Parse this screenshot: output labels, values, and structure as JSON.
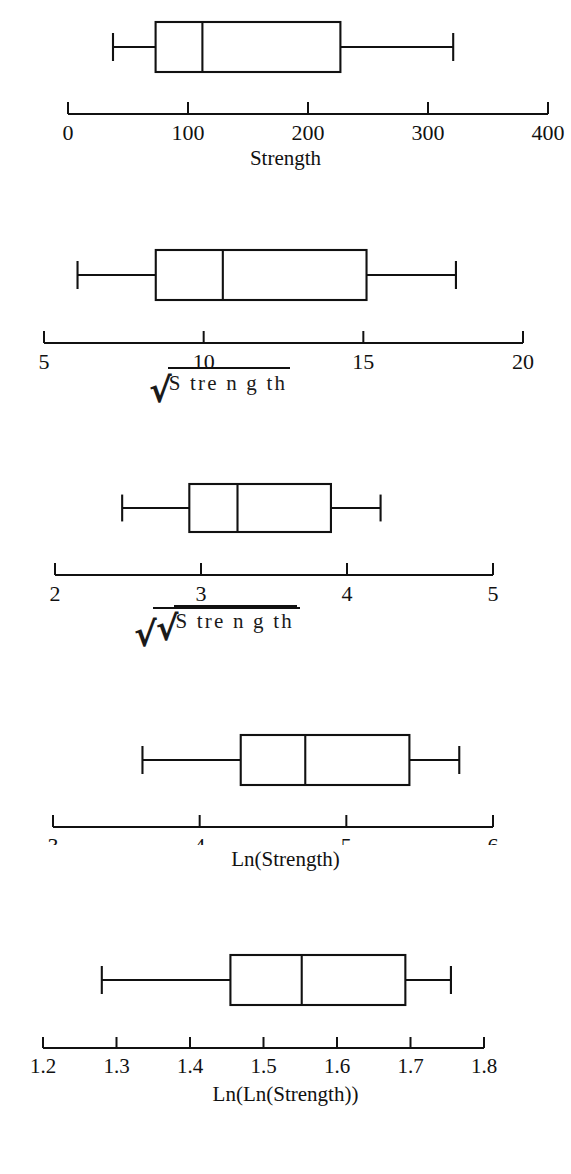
{
  "figure": {
    "title": "",
    "background": "#ffffff",
    "line_color": "#111111",
    "width": 571,
    "height": 1174
  },
  "chart_data": [
    {
      "type": "box",
      "id": "strength",
      "title": "",
      "xlabel": "Strength",
      "xlabel_kind": "plain",
      "xlim": [
        0,
        400
      ],
      "ticks": [
        0,
        100,
        200,
        300,
        400
      ],
      "tick_labels": [
        "0",
        "100",
        "200",
        "300",
        "400"
      ],
      "grid": false,
      "orientation": "horizontal",
      "stats": {
        "min": 37.5,
        "q1": 73.0,
        "median": 112.0,
        "q3": 227.0,
        "max": 321.0
      }
    },
    {
      "type": "box",
      "id": "sqrt-strength",
      "title": "",
      "xlabel": "Strength",
      "xlabel_kind": "sqrt",
      "xlim": [
        5,
        20
      ],
      "ticks": [
        5,
        10,
        15,
        20
      ],
      "tick_labels": [
        "5",
        "10",
        "15",
        "20"
      ],
      "grid": false,
      "orientation": "horizontal",
      "stats": {
        "min": 6.05,
        "q1": 8.5,
        "median": 10.6,
        "q3": 15.1,
        "max": 17.9
      }
    },
    {
      "type": "box",
      "id": "fourth-root-strength",
      "title": "",
      "xlabel": "Strength",
      "xlabel_kind": "sqrt-sqrt",
      "xlim": [
        2,
        5
      ],
      "ticks": [
        2,
        3,
        4,
        5
      ],
      "tick_labels": [
        "2",
        "3",
        "4",
        "5"
      ],
      "grid": false,
      "orientation": "horizontal",
      "stats": {
        "min": 2.46,
        "q1": 2.92,
        "median": 3.25,
        "q3": 3.89,
        "max": 4.23
      }
    },
    {
      "type": "box",
      "id": "ln-strength",
      "title": "",
      "xlabel": "Ln(Strength)",
      "xlabel_kind": "plain",
      "xlim": [
        3,
        6
      ],
      "ticks": [
        3,
        4,
        5,
        6
      ],
      "tick_labels": [
        "3",
        "4",
        "5",
        "6"
      ],
      "grid": false,
      "orientation": "horizontal",
      "stats": {
        "min": 3.61,
        "q1": 4.28,
        "median": 4.72,
        "q3": 5.43,
        "max": 5.77
      }
    },
    {
      "type": "box",
      "id": "lnln-strength",
      "title": "",
      "xlabel": "Ln(Ln(Strength))",
      "xlabel_kind": "plain",
      "xlim": [
        1.2,
        1.8
      ],
      "ticks": [
        1.2,
        1.3,
        1.4,
        1.5,
        1.6,
        1.7,
        1.8
      ],
      "tick_labels": [
        "1.2",
        "1.3",
        "1.4",
        "1.5",
        "1.6",
        "1.7",
        "1.8"
      ],
      "grid": false,
      "orientation": "horizontal",
      "stats": {
        "min": 1.28,
        "q1": 1.455,
        "median": 1.552,
        "q3": 1.693,
        "max": 1.755
      }
    }
  ],
  "labels": {
    "radical_glyph": "√",
    "strength_text": "S tre n g th",
    "plot1_label": "Strength",
    "plot4_label": "Ln(Strength)",
    "plot5_label": "Ln(Ln(Strength))"
  }
}
